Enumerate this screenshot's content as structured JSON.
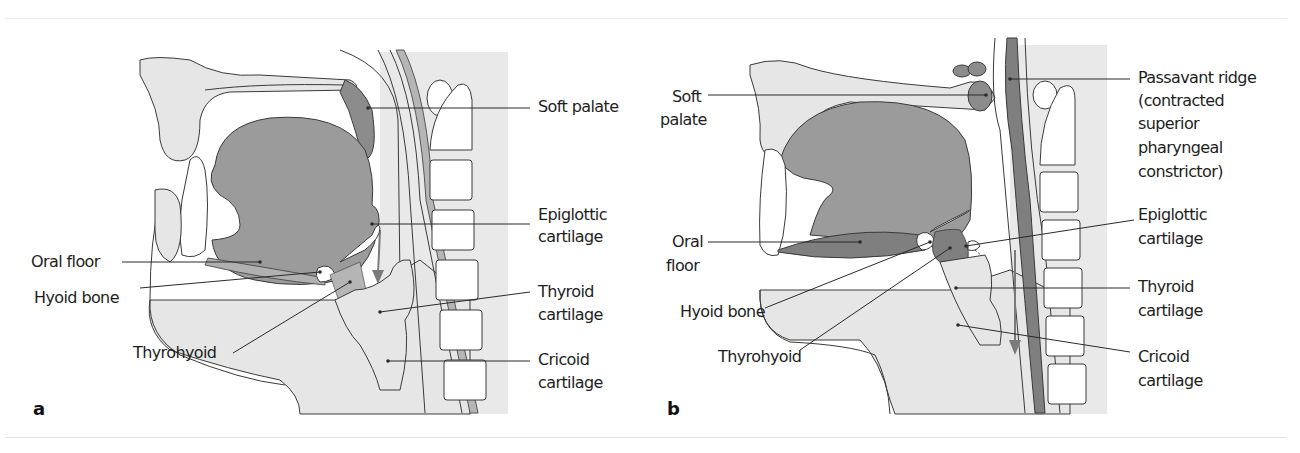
{
  "colors": {
    "outline": "#3a3a3a",
    "tissue_light": "#e6e6e6",
    "tongue": "#9b9b9b",
    "muscle_dark": "#7f7f7f",
    "thyrohyoid": "#b5b5b5",
    "background": "#ffffff"
  },
  "panels": [
    {
      "id": "a",
      "panel_label": "a",
      "labels": {
        "soft_palate": "Soft palate",
        "epiglottic_1": "Epiglottic",
        "epiglottic_2": "cartilage",
        "oral_floor": "Oral floor",
        "hyoid_bone": "Hyoid bone",
        "thyroid_1": "Thyroid",
        "thyroid_2": "cartilage",
        "thyrohyoid": "Thyrohyoid",
        "cricoid_1": "Cricoid",
        "cricoid_2": "cartilage"
      }
    },
    {
      "id": "b",
      "panel_label": "b",
      "labels": {
        "soft_palate_1": "Soft",
        "soft_palate_2": "palate",
        "passavant_1": "Passavant ridge",
        "passavant_2": "(contracted",
        "passavant_3": "superior",
        "passavant_4": "pharyngeal",
        "passavant_5": "constrictor)",
        "epiglottic_1": "Epiglottic",
        "epiglottic_2": "cartilage",
        "oral_floor_1": "Oral",
        "oral_floor_2": "floor",
        "hyoid_bone": "Hyoid bone",
        "thyroid_1": "Thyroid",
        "thyroid_2": "cartilage",
        "thyrohyoid": "Thyrohyoid",
        "cricoid_1": "Cricoid",
        "cricoid_2": "cartilage"
      }
    }
  ]
}
